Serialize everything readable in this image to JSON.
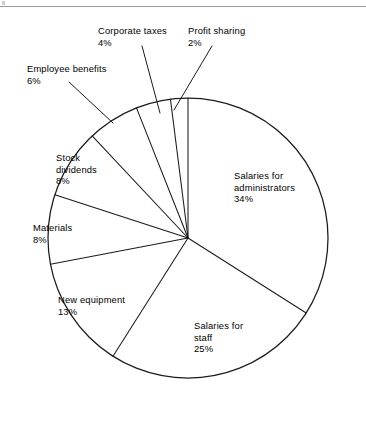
{
  "page": {
    "background_color": "#ffffff",
    "ink_color": "#1b1b1b",
    "has_top_rule": true
  },
  "chart_data": {
    "type": "pie",
    "title": "",
    "subtitle": "",
    "xlabel": "",
    "ylabel": "",
    "legend_position": "none",
    "grid": false,
    "style": "outline-only black and white pie chart, labels placed outside with leader lines",
    "start_angle_deg": 0,
    "direction": "clockwise",
    "center": {
      "x": 188,
      "y": 238
    },
    "radius": 140,
    "total_percent": 100,
    "categories": [
      "Salaries for administrators",
      "Salaries for staff",
      "New equipment",
      "Materials",
      "Stock dividends",
      "Employee benefits",
      "Corporate taxes",
      "Profit sharing"
    ],
    "values": [
      34,
      25,
      13,
      8,
      8,
      6,
      4,
      2
    ],
    "slices": [
      {
        "key": "salaries-admin",
        "name": "Salaries for administrators",
        "value": 34,
        "value_label": "34%",
        "label_line1": "Salaries for",
        "label_line2": "administrators",
        "label_line3": "34%"
      },
      {
        "key": "salaries-staff",
        "name": "Salaries for staff",
        "value": 25,
        "value_label": "25%",
        "label_line1": "Salaries for",
        "label_line2": "staff",
        "label_line3": "25%"
      },
      {
        "key": "new-equipment",
        "name": "New equipment",
        "value": 13,
        "value_label": "13%",
        "label_line1": "New equipment",
        "label_line2": "13%",
        "label_line3": ""
      },
      {
        "key": "materials",
        "name": "Materials",
        "value": 8,
        "value_label": "8%",
        "label_line1": "Materials",
        "label_line2": "8%",
        "label_line3": ""
      },
      {
        "key": "stock-dividends",
        "name": "Stock dividends",
        "value": 8,
        "value_label": "8%",
        "label_line1": "Stock",
        "label_line2": "dividends",
        "label_line3": "8%"
      },
      {
        "key": "employee-benefits",
        "name": "Employee benefits",
        "value": 6,
        "value_label": "6%",
        "label_line1": "Employee benefits",
        "label_line2": "6%",
        "label_line3": ""
      },
      {
        "key": "corporate-taxes",
        "name": "Corporate taxes",
        "value": 4,
        "value_label": "4%",
        "label_line1": "Corporate taxes",
        "label_line2": "4%",
        "label_line3": ""
      },
      {
        "key": "profit-sharing",
        "name": "Profit sharing",
        "value": 2,
        "value_label": "2%",
        "label_line1": "Profit sharing",
        "label_line2": "2%",
        "label_line3": ""
      }
    ]
  },
  "labels": {
    "salaries_admin": {
      "line1": "Salaries for",
      "line2": "administrators",
      "pct": "34%"
    },
    "salaries_staff": {
      "line1": "Salaries for",
      "line2": "staff",
      "pct": "25%"
    },
    "new_equipment": {
      "line1": "New equipment",
      "pct": "13%"
    },
    "materials": {
      "line1": "Materials",
      "pct": "8%"
    },
    "stock_dividends": {
      "line1": "Stock",
      "line2": "dividends",
      "pct": "8%"
    },
    "employee_benefits": {
      "line1": "Employee benefits",
      "pct": "6%"
    },
    "corporate_taxes": {
      "line1": "Corporate taxes",
      "pct": "4%"
    },
    "profit_sharing": {
      "line1": "Profit sharing",
      "pct": "2%"
    }
  }
}
